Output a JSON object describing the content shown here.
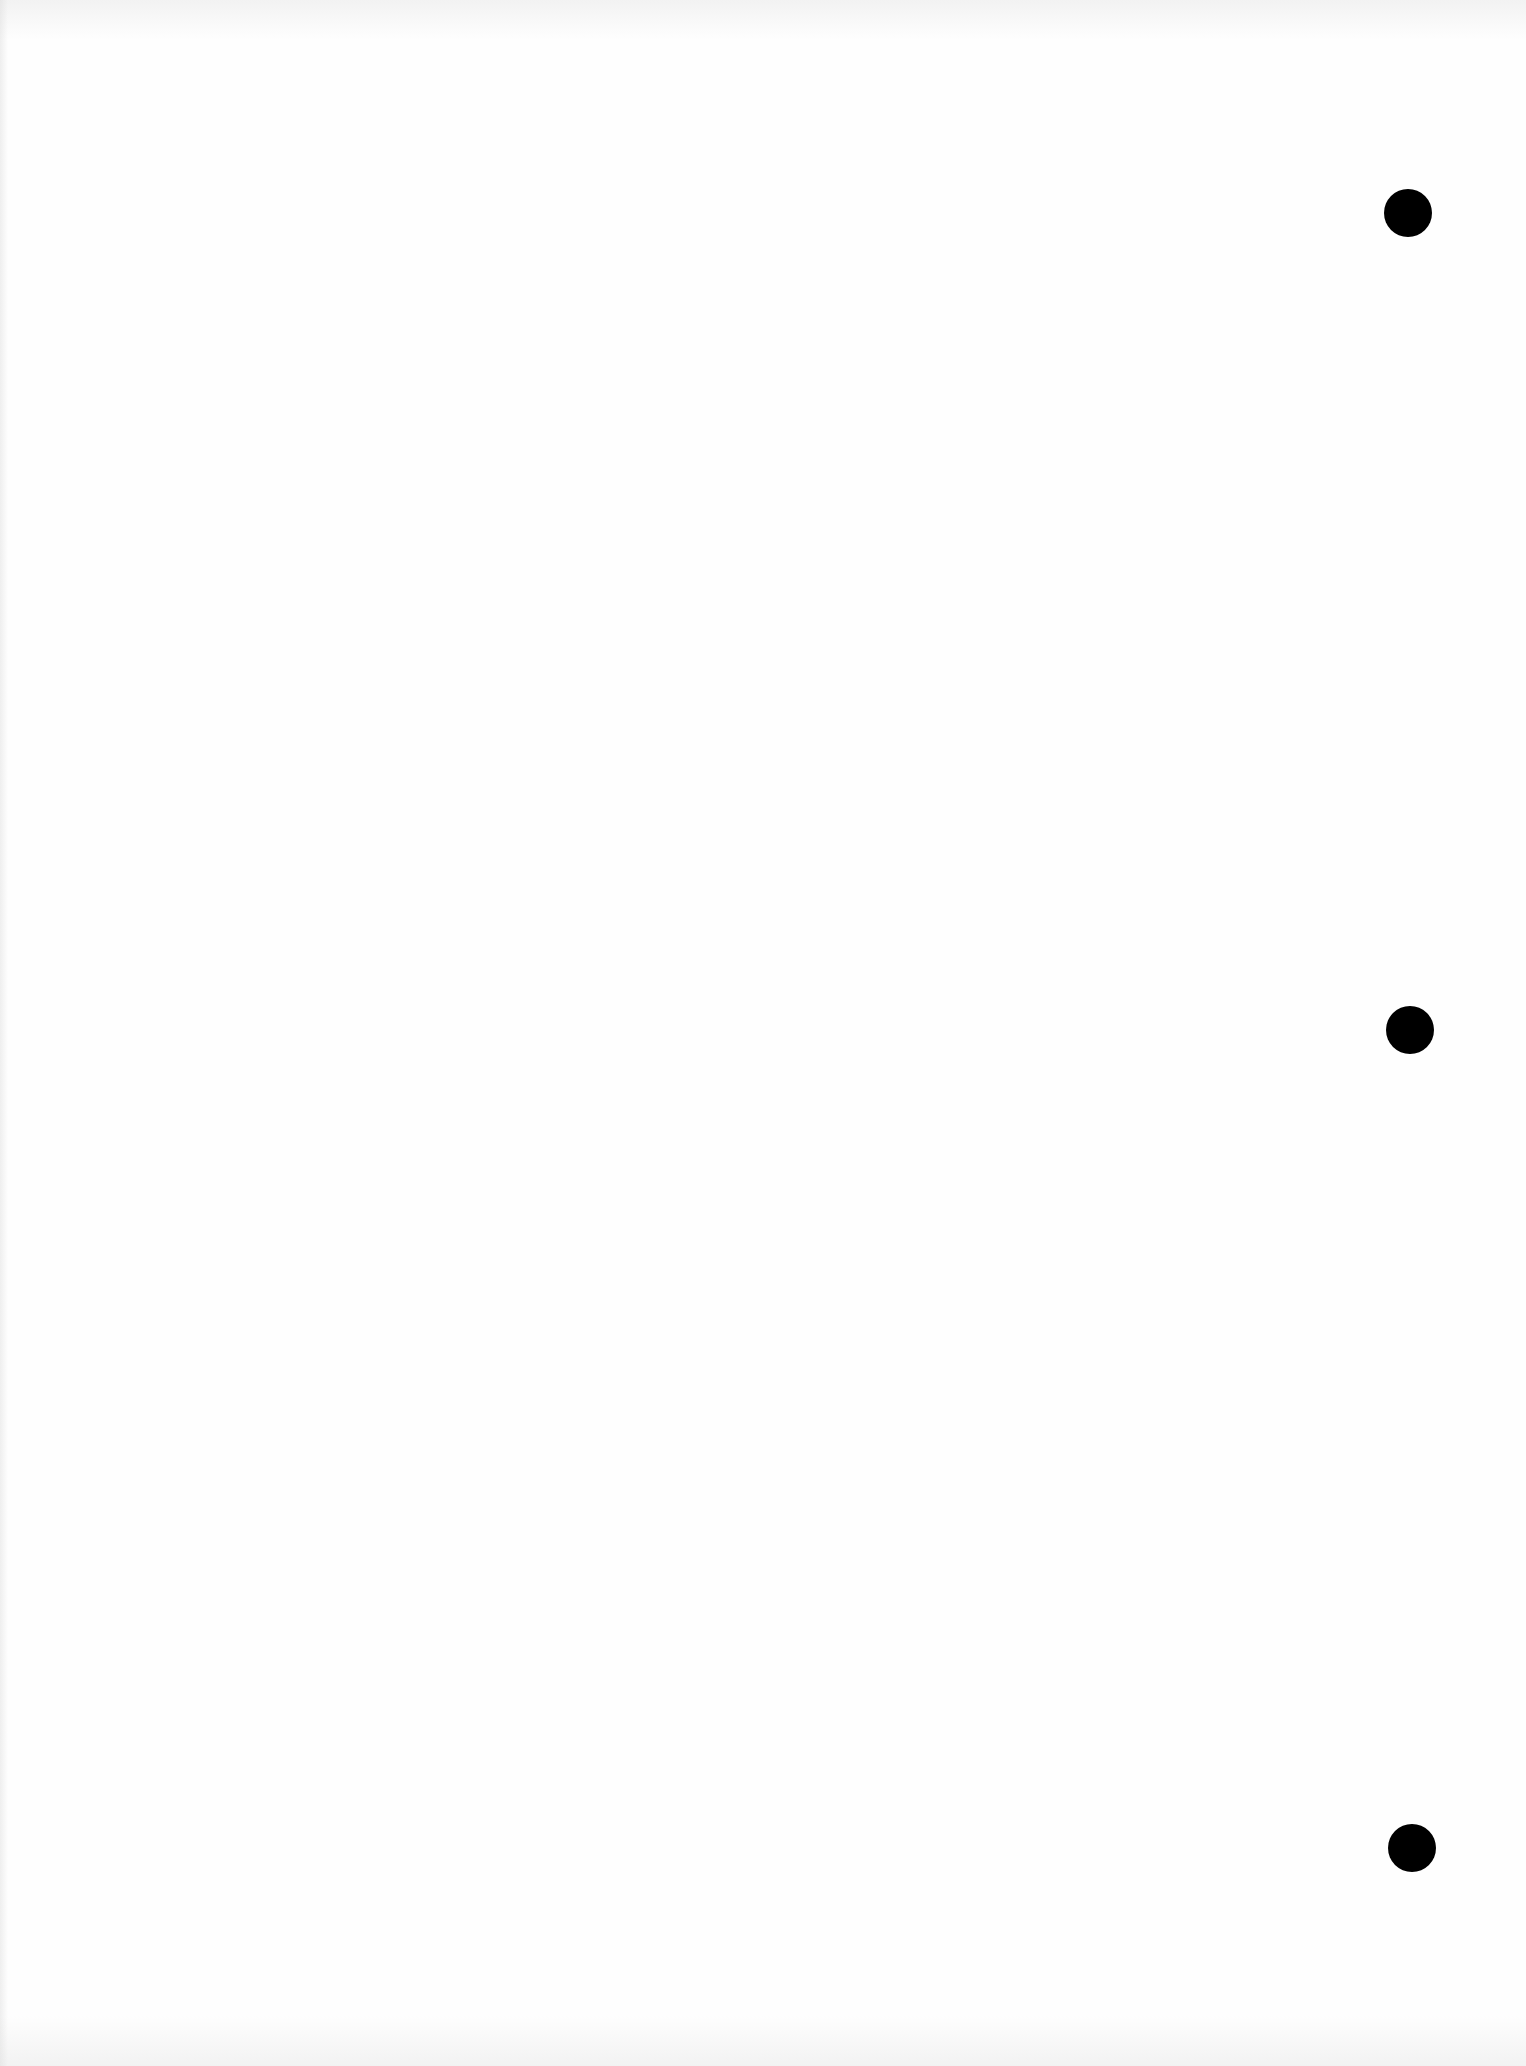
{
  "document": {
    "type": "blank scanned page",
    "background_color": "#fefefe",
    "text_content": ""
  },
  "punch_holes": [
    {
      "cx": 1408,
      "cy": 213,
      "r": 24,
      "color": "#000000"
    },
    {
      "cx": 1410,
      "cy": 1030,
      "r": 24,
      "color": "#000000"
    },
    {
      "cx": 1412,
      "cy": 1848,
      "r": 24,
      "color": "#000000"
    }
  ]
}
